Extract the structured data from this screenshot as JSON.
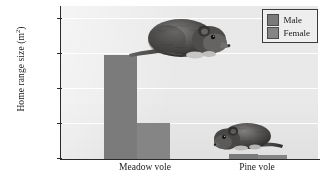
{
  "chart_data": {
    "type": "bar",
    "title": "",
    "subtitle": "",
    "xlabel": "",
    "ylabel": "Home range size (m²)",
    "ylabel_text": "Home range size (m",
    "ylabel_sup": "2",
    "ylabel_tail": ")",
    "categories": [
      "Meadow vole",
      "Pine vole"
    ],
    "series": [
      {
        "name": "Male",
        "values": [
          600,
          30
        ],
        "color": "#7b7b7b"
      },
      {
        "name": "Female",
        "values": [
          205,
          25
        ],
        "color": "#858585"
      }
    ],
    "ylim": [
      0,
      880
    ],
    "yticks": [
      0,
      200,
      400,
      600,
      800
    ],
    "ytick_labels": [
      "0",
      "200",
      "400",
      "600",
      "800"
    ],
    "grid": true,
    "grid_axis": "y",
    "legend_position": "top-right",
    "annotations": [
      {
        "name": "meadow-vole-photo",
        "label": "Meadow vole photograph",
        "category": "Meadow vole"
      },
      {
        "name": "pine-vole-photo",
        "label": "Pine vole photograph",
        "category": "Pine vole"
      }
    ]
  },
  "legend": {
    "entries": [
      {
        "label": "Male",
        "color": "#7b7b7b"
      },
      {
        "label": "Female",
        "color": "#858585"
      }
    ]
  },
  "axes": {
    "y": {
      "title_main": "Home range size (m",
      "title_sup": "2",
      "title_end": ")",
      "ticks": [
        "800",
        "600",
        "400",
        "200",
        "0"
      ]
    },
    "x": {
      "categories": [
        "Meadow vole",
        "Pine vole"
      ]
    }
  },
  "colors": {
    "male": "#7b7b7b",
    "female": "#858585",
    "plot_background": "#e9e9e9",
    "axis": "#2a2a2a",
    "gridline": "#ffffff",
    "text": "#1b1b1b"
  }
}
